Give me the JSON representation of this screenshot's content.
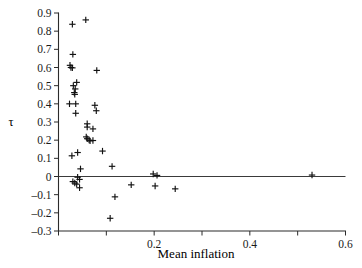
{
  "chart_data": {
    "type": "scatter",
    "title": "",
    "xlabel": "Mean inflation",
    "ylabel": "τ",
    "xlim": [
      0.0,
      0.6
    ],
    "ylim": [
      -0.3,
      0.9
    ],
    "xticks": [
      0.0,
      0.1,
      0.2,
      0.3,
      0.4,
      0.5,
      0.6
    ],
    "xticklabels": [
      "",
      "",
      "0.2",
      "",
      "0.4",
      "",
      "0.6"
    ],
    "yticks": [
      -0.3,
      -0.2,
      -0.1,
      0.0,
      0.1,
      0.2,
      0.3,
      0.4,
      0.5,
      0.6,
      0.7,
      0.8,
      0.9
    ],
    "yticklabels": [
      "-0.3",
      "-0.2",
      "-0.1",
      "0",
      "0.1",
      "0.2",
      "0.3",
      "0.4",
      "0.5",
      "0.6",
      "0.7",
      "0.8",
      "0.9"
    ],
    "grid": false,
    "legend": null,
    "marker": "plus",
    "marker_color": "#111111",
    "reference_line_y": 0.0,
    "points": [
      {
        "x": 0.029,
        "y": 0.838
      },
      {
        "x": 0.057,
        "y": 0.862
      },
      {
        "x": 0.03,
        "y": 0.672
      },
      {
        "x": 0.024,
        "y": 0.612
      },
      {
        "x": 0.026,
        "y": 0.6
      },
      {
        "x": 0.029,
        "y": 0.598
      },
      {
        "x": 0.08,
        "y": 0.584
      },
      {
        "x": 0.038,
        "y": 0.518
      },
      {
        "x": 0.031,
        "y": 0.5
      },
      {
        "x": 0.035,
        "y": 0.482
      },
      {
        "x": 0.033,
        "y": 0.462
      },
      {
        "x": 0.034,
        "y": 0.452
      },
      {
        "x": 0.023,
        "y": 0.4
      },
      {
        "x": 0.036,
        "y": 0.4
      },
      {
        "x": 0.076,
        "y": 0.392
      },
      {
        "x": 0.079,
        "y": 0.362
      },
      {
        "x": 0.036,
        "y": 0.348
      },
      {
        "x": 0.06,
        "y": 0.29
      },
      {
        "x": 0.06,
        "y": 0.272
      },
      {
        "x": 0.072,
        "y": 0.262
      },
      {
        "x": 0.058,
        "y": 0.218
      },
      {
        "x": 0.06,
        "y": 0.208
      },
      {
        "x": 0.064,
        "y": 0.2
      },
      {
        "x": 0.072,
        "y": 0.198
      },
      {
        "x": 0.066,
        "y": 0.196
      },
      {
        "x": 0.092,
        "y": 0.14
      },
      {
        "x": 0.04,
        "y": 0.132
      },
      {
        "x": 0.028,
        "y": 0.114
      },
      {
        "x": 0.112,
        "y": 0.056
      },
      {
        "x": 0.046,
        "y": 0.042
      },
      {
        "x": 0.198,
        "y": 0.014
      },
      {
        "x": 0.206,
        "y": 0.006
      },
      {
        "x": 0.53,
        "y": 0.008
      },
      {
        "x": 0.04,
        "y": -0.004
      },
      {
        "x": 0.044,
        "y": -0.016
      },
      {
        "x": 0.03,
        "y": -0.028
      },
      {
        "x": 0.034,
        "y": -0.036
      },
      {
        "x": 0.038,
        "y": -0.042
      },
      {
        "x": 0.044,
        "y": -0.062
      },
      {
        "x": 0.152,
        "y": -0.046
      },
      {
        "x": 0.202,
        "y": -0.052
      },
      {
        "x": 0.244,
        "y": -0.068
      },
      {
        "x": 0.118,
        "y": -0.112
      },
      {
        "x": 0.108,
        "y": -0.23
      }
    ]
  }
}
